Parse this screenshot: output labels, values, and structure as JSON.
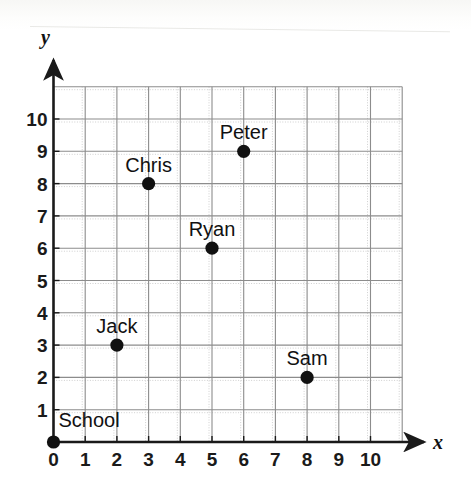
{
  "figure": {
    "kind": "coordinate-plane-scatter",
    "background_color": "#ffffff",
    "grid_color": "#8c8c8c",
    "axis_color": "#1a1a1a",
    "point_color": "#111111"
  },
  "axes": {
    "x": {
      "name": "x",
      "ticks": [
        "0",
        "1",
        "2",
        "3",
        "4",
        "5",
        "6",
        "7",
        "8",
        "9",
        "10"
      ],
      "min": 0,
      "max": 10,
      "arrow": true
    },
    "y": {
      "name": "y",
      "ticks": [
        "1",
        "2",
        "3",
        "4",
        "5",
        "6",
        "7",
        "8",
        "9",
        "10"
      ],
      "min": 0,
      "max": 10,
      "arrow": true
    }
  },
  "chart_data": {
    "type": "scatter",
    "title": "",
    "xlabel": "x",
    "ylabel": "y",
    "xlim": [
      0,
      11
    ],
    "ylim": [
      0,
      11
    ],
    "xticks": [
      0,
      1,
      2,
      3,
      4,
      5,
      6,
      7,
      8,
      9,
      10
    ],
    "yticks": [
      1,
      2,
      3,
      4,
      5,
      6,
      7,
      8,
      9,
      10
    ],
    "grid": true,
    "legend": "none",
    "points": [
      {
        "label": "School",
        "x": 0,
        "y": 0,
        "label_pos": "right"
      },
      {
        "label": "Jack",
        "x": 2,
        "y": 3,
        "label_pos": "above"
      },
      {
        "label": "Chris",
        "x": 3,
        "y": 8,
        "label_pos": "above"
      },
      {
        "label": "Ryan",
        "x": 5,
        "y": 6,
        "label_pos": "above"
      },
      {
        "label": "Peter",
        "x": 6,
        "y": 9,
        "label_pos": "above"
      },
      {
        "label": "Sam",
        "x": 8,
        "y": 2,
        "label_pos": "above"
      }
    ]
  }
}
